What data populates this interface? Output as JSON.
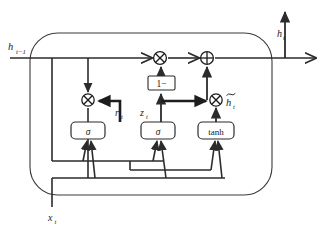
{
  "figure": {
    "name": "GRU cell diagram",
    "type": "diagram",
    "background_color": "#ffffff",
    "line_color": "#2b2b2b",
    "text_color": "#1a1a1a"
  },
  "inputs": {
    "hidden_prev": "h",
    "hidden_prev_sub": "t−1",
    "input_x": "x",
    "input_x_sub": "t"
  },
  "outputs": {
    "hidden_out": "h",
    "hidden_out_sub": "t",
    "hidden_right": "h",
    "hidden_right_sub": "t"
  },
  "gates": {
    "reset": {
      "symbol": "r",
      "sub": "t",
      "activation": "σ"
    },
    "update": {
      "symbol": "z",
      "sub": "t",
      "activation": "σ"
    },
    "candidate": {
      "symbol": "h̃",
      "sub": "t",
      "activation": "tanh"
    }
  },
  "boxes": [
    {
      "id": "sigma-reset",
      "label": "σ",
      "x": 88,
      "y": 129
    },
    {
      "id": "sigma-update",
      "label": "σ",
      "x": 158,
      "y": 129
    },
    {
      "id": "tanh-candidate",
      "label": "tanh",
      "x": 216,
      "y": 129
    },
    {
      "id": "one-minus",
      "label": "1−",
      "x": 161,
      "y": 84
    }
  ],
  "operators": [
    {
      "id": "mul-reset",
      "glyph": "⊗",
      "name": "multiply",
      "x": 88,
      "y": 100
    },
    {
      "id": "mul-forget",
      "glyph": "⊗",
      "name": "multiply",
      "x": 160,
      "y": 58
    },
    {
      "id": "add-output",
      "glyph": "⊕",
      "name": "add",
      "x": 207,
      "y": 58
    },
    {
      "id": "mul-candidate",
      "glyph": "⊗",
      "name": "multiply",
      "x": 216,
      "y": 100
    }
  ],
  "labels": {
    "h_prev": "h",
    "h_prev_sub": "t−1",
    "r_t": "r",
    "r_t_sub": "t",
    "z_t": "z",
    "z_t_sub": "t",
    "h_tilde": "h",
    "h_tilde_sub": "t",
    "x_t": "x",
    "x_t_sub": "t",
    "h_t_top": "h",
    "h_t_top_sub": "t",
    "one_minus": "1−",
    "sigma": "σ",
    "tanh": "tanh"
  }
}
